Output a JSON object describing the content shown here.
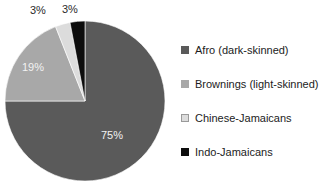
{
  "chart_data": {
    "type": "pie",
    "title": "",
    "categories": [
      "Afro (dark-skinned)",
      "Brownings (light-skinned)",
      "Chinese-Jamaicans",
      "Indo-Jamaicans"
    ],
    "values": [
      75,
      19,
      3,
      3
    ],
    "value_labels": [
      "75%",
      "19%",
      "3%",
      "3%"
    ],
    "colors": [
      "#5a5a5a",
      "#a8a8a8",
      "#dcdcdc",
      "#0d0d0d"
    ],
    "legend_position": "right",
    "grid": false,
    "start_angle_deg": 0,
    "direction": "clockwise",
    "xlabel": "",
    "ylabel": ""
  },
  "legend": {
    "items": [
      {
        "label": "Afro (dark-skinned)",
        "color": "#5a5a5a"
      },
      {
        "label": "Brownings (light-skinned)",
        "color": "#a8a8a8"
      },
      {
        "label": "Chinese-Jamaicans",
        "color": "#dcdcdc"
      },
      {
        "label": "Indo-Jamaicans",
        "color": "#0d0d0d"
      }
    ]
  },
  "pie_labels": {
    "afro": "75%",
    "brownings": "19%",
    "chinese": "3%",
    "indo": "3%"
  }
}
